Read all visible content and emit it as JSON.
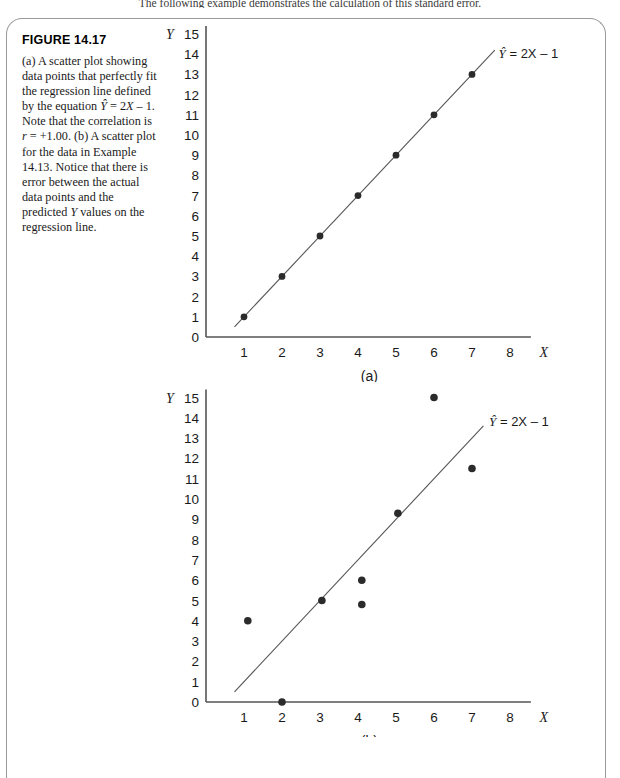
{
  "running_head": "The following example demonstrates the calculation of this standard error.",
  "caption": {
    "figure_number": "FIGURE 14.17",
    "body_parts": [
      {
        "text": "(a) A scatter plot showing data points that perfectly fit the regression line defined by the equation ",
        "style": "normal"
      },
      {
        "text": "Y",
        "style": "italic-hat"
      },
      {
        "text": " = 2",
        "style": "normal"
      },
      {
        "text": "X",
        "style": "italic"
      },
      {
        "text": " – 1. Note that the correlation is ",
        "style": "normal"
      },
      {
        "text": "r",
        "style": "italic"
      },
      {
        "text": " = +1.00. (b) A scatter plot for the data in Example 14.13. Notice that there is error between the actual data points and the predicted ",
        "style": "normal"
      },
      {
        "text": "Y",
        "style": "italic"
      },
      {
        "text": " values on the regression line.",
        "style": "normal"
      }
    ],
    "full_text": "(a) A scatter plot showing data points that perfectly fit the regression line defined by the equation Ŷ = 2X – 1. Note that the correlation is r = +1.00. (b) A scatter plot for the data in Example 14.13. Notice that there is error between the actual data points and the predicted Y values on the regression line."
  },
  "chart_data": [
    {
      "type": "scatter",
      "panel_label": "(a)",
      "title": "",
      "xlabel": "X",
      "ylabel": "Y",
      "xlim": [
        0,
        9
      ],
      "ylim": [
        0,
        15
      ],
      "xticks": [
        1,
        2,
        3,
        4,
        5,
        6,
        7,
        8
      ],
      "yticks": [
        0,
        1,
        2,
        3,
        4,
        5,
        6,
        7,
        8,
        9,
        10,
        11,
        12,
        13,
        14,
        15
      ],
      "grid": false,
      "legend": "none",
      "points": [
        {
          "x": 1,
          "y": 1
        },
        {
          "x": 2,
          "y": 3
        },
        {
          "x": 3,
          "y": 5
        },
        {
          "x": 4,
          "y": 7
        },
        {
          "x": 5,
          "y": 9
        },
        {
          "x": 6,
          "y": 11
        },
        {
          "x": 7,
          "y": 13
        }
      ],
      "line": {
        "label": "Ŷ = 2X – 1",
        "slope": 2,
        "intercept": -1,
        "x_start": 0.75,
        "x_end": 7.6
      },
      "annotations": [
        {
          "text": "Ŷ = 2X – 1",
          "x": 7.7,
          "y": 13.8
        }
      ]
    },
    {
      "type": "scatter",
      "panel_label": "(b)",
      "title": "",
      "xlabel": "X",
      "ylabel": "Y",
      "xlim": [
        0,
        9
      ],
      "ylim": [
        0,
        15
      ],
      "xticks": [
        1,
        2,
        3,
        4,
        5,
        6,
        7,
        8
      ],
      "yticks": [
        0,
        1,
        2,
        3,
        4,
        5,
        6,
        7,
        8,
        9,
        10,
        11,
        12,
        13,
        14,
        15
      ],
      "grid": false,
      "legend": "none",
      "points": [
        {
          "x": 1.1,
          "y": 4
        },
        {
          "x": 2,
          "y": 0
        },
        {
          "x": 3.05,
          "y": 5
        },
        {
          "x": 4.1,
          "y": 6
        },
        {
          "x": 4.1,
          "y": 4.8
        },
        {
          "x": 5.05,
          "y": 9.3
        },
        {
          "x": 6,
          "y": 15
        },
        {
          "x": 7,
          "y": 11.5
        }
      ],
      "line": {
        "label": "Ŷ = 2X – 1",
        "slope": 2,
        "intercept": -1,
        "x_start": 0.75,
        "x_end": 7.3
      },
      "annotations": [
        {
          "text": "Ŷ = 2X – 1",
          "x": 7.45,
          "y": 13.6
        }
      ]
    }
  ],
  "equation_label": {
    "y_hat": "Y",
    "rest": " = 2X – 1",
    "full": "Ŷ = 2X – 1"
  },
  "colors": {
    "axis": "#555555",
    "dot": "#2b2b2b",
    "frame": "#9a9a9a",
    "text": "#1a1a1a"
  }
}
